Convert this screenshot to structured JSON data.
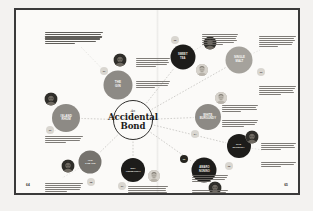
{
  "spread": {
    "publication_style": "magazine-feature-spread",
    "background_color": "#f3f2f0",
    "page_color": "#fbfaf8",
    "frame_color": "#3a3a3a"
  },
  "hub": {
    "kicker": "An",
    "title_line_1": "Accidental",
    "title_line_2": "Bond",
    "outline_color": "#2e2d2b"
  },
  "folios": {
    "left": "64",
    "right": "65"
  },
  "palette": {
    "node_dark": "#1d1c1a",
    "node_gray": "#8d8a85",
    "node_gray_light": "#a5a29c",
    "node_gray_dark": "#76736e",
    "badge_light": "#d9d6d0",
    "badge_dark": "#26251f",
    "text_body": "#6d6a65"
  },
  "nodes": [
    {
      "id": "n1",
      "label_line_1": "THE",
      "label_line_2": "GIN",
      "tone": "gray",
      "x": 102,
      "y": 75,
      "d": 29
    },
    {
      "id": "n2",
      "label_line_1": "SWEET",
      "label_line_2": "TEA",
      "tone": "dark",
      "x": 167,
      "y": 47,
      "d": 25
    },
    {
      "id": "n3",
      "label_line_1": "SINGLE",
      "label_line_2": "MALT",
      "tone": "gray2",
      "x": 223,
      "y": 50,
      "d": 27
    },
    {
      "id": "n4",
      "label_line_1": "WHITE",
      "label_line_2": "BURGUNDY",
      "tone": "gray",
      "x": 192,
      "y": 107,
      "d": 26
    },
    {
      "id": "n5",
      "label_line_1": "RYE",
      "label_line_2": "WHISKEY",
      "tone": "dark",
      "x": 223,
      "y": 136,
      "d": 24
    },
    {
      "id": "n6",
      "label_line_1": "AMARO",
      "label_line_2": "NONINO",
      "tone": "dark",
      "x": 188,
      "y": 160,
      "d": 25
    },
    {
      "id": "n7",
      "label_line_1": "DRY",
      "label_line_2": "VERMOUTH",
      "tone": "dark",
      "x": 117,
      "y": 160,
      "d": 24
    },
    {
      "id": "n8",
      "label_line_1": "OLD",
      "label_line_2": "TOM GIN",
      "tone": "gray3",
      "x": 74,
      "y": 152,
      "d": 23
    },
    {
      "id": "n9",
      "label_line_1": "ISLAND",
      "label_line_2": "RHUM",
      "tone": "gray",
      "x": 50,
      "y": 108,
      "d": 28
    }
  ],
  "badges": [
    {
      "id": "b1",
      "value": "01",
      "tone": "light",
      "x": 88,
      "y": 61,
      "d": 8
    },
    {
      "id": "b2",
      "value": "02",
      "tone": "light",
      "x": 159,
      "y": 30,
      "d": 8
    },
    {
      "id": "b3",
      "value": "03",
      "tone": "light",
      "x": 245,
      "y": 62,
      "d": 8
    },
    {
      "id": "b4",
      "value": "04",
      "tone": "light",
      "x": 179,
      "y": 124,
      "d": 8
    },
    {
      "id": "b5",
      "value": "05",
      "tone": "light",
      "x": 213,
      "y": 156,
      "d": 8
    },
    {
      "id": "b6",
      "value": "06",
      "tone": "dark",
      "x": 168,
      "y": 149,
      "d": 8
    },
    {
      "id": "b7",
      "value": "07",
      "tone": "light",
      "x": 106,
      "y": 176,
      "d": 8
    },
    {
      "id": "b8",
      "value": "08",
      "tone": "light",
      "x": 75,
      "y": 172,
      "d": 8
    },
    {
      "id": "b9",
      "value": "09",
      "tone": "light",
      "x": 34,
      "y": 120,
      "d": 8
    }
  ],
  "portraits": [
    {
      "id": "p1",
      "x": 104,
      "y": 50,
      "d": 13,
      "tone": "dark"
    },
    {
      "id": "p2",
      "x": 194,
      "y": 33,
      "d": 13,
      "tone": "dark"
    },
    {
      "id": "p3",
      "x": 186,
      "y": 60,
      "d": 12,
      "tone": "light"
    },
    {
      "id": "p4",
      "x": 205,
      "y": 88,
      "d": 12,
      "tone": "light"
    },
    {
      "id": "p5",
      "x": 236,
      "y": 127,
      "d": 13,
      "tone": "dark"
    },
    {
      "id": "p6",
      "x": 199,
      "y": 178,
      "d": 13,
      "tone": "dark"
    },
    {
      "id": "p7",
      "x": 138,
      "y": 166,
      "d": 12,
      "tone": "light"
    },
    {
      "id": "p8",
      "x": 52,
      "y": 156,
      "d": 13,
      "tone": "dark"
    },
    {
      "id": "p9",
      "x": 35,
      "y": 89,
      "d": 13,
      "tone": "dark"
    }
  ],
  "copy_blocks": [
    {
      "id": "c1",
      "x": 29,
      "y": 22,
      "w": 58,
      "lead": true,
      "lines": [
        100,
        96,
        98,
        94,
        88,
        52
      ]
    },
    {
      "id": "c2",
      "x": 120,
      "y": 48,
      "w": 34,
      "lead": false,
      "lines": [
        100,
        95,
        97,
        92,
        60
      ]
    },
    {
      "id": "c3",
      "x": 120,
      "y": 71,
      "w": 34,
      "lead": false,
      "lines": [
        100,
        96,
        93,
        55
      ]
    },
    {
      "id": "c4",
      "x": 186,
      "y": 24,
      "w": 36,
      "lead": false,
      "lines": [
        100,
        97,
        94,
        96,
        90,
        58
      ]
    },
    {
      "id": "c5",
      "x": 243,
      "y": 26,
      "w": 37,
      "lead": false,
      "lines": [
        100,
        95,
        97,
        93,
        88,
        50
      ]
    },
    {
      "id": "c6",
      "x": 243,
      "y": 76,
      "w": 37,
      "lead": false,
      "lines": [
        100,
        96,
        92,
        95,
        60
      ]
    },
    {
      "id": "c7",
      "x": 206,
      "y": 95,
      "w": 36,
      "lead": false,
      "lines": [
        100,
        94,
        96,
        52
      ]
    },
    {
      "id": "c8",
      "x": 206,
      "y": 110,
      "w": 36,
      "lead": false,
      "lines": [
        100,
        96,
        93,
        62
      ]
    },
    {
      "id": "c9",
      "x": 245,
      "y": 133,
      "w": 35,
      "lead": false,
      "lines": [
        100,
        95,
        97,
        58
      ]
    },
    {
      "id": "c10",
      "x": 245,
      "y": 152,
      "w": 35,
      "lead": false,
      "lines": [
        100,
        94,
        56
      ]
    },
    {
      "id": "c11",
      "x": 176,
      "y": 165,
      "w": 36,
      "lead": false,
      "lines": [
        100,
        96,
        92,
        54
      ]
    },
    {
      "id": "c12",
      "x": 176,
      "y": 180,
      "w": 36,
      "lead": false,
      "lines": [
        100,
        95,
        93,
        60
      ]
    },
    {
      "id": "c13",
      "x": 112,
      "y": 176,
      "w": 40,
      "lead": false,
      "lines": [
        100,
        96,
        94,
        97,
        90,
        55
      ]
    },
    {
      "id": "c14",
      "x": 29,
      "y": 173,
      "w": 38,
      "lead": false,
      "lines": [
        100,
        95,
        96,
        92,
        58
      ]
    },
    {
      "id": "c15",
      "x": 29,
      "y": 126,
      "w": 38,
      "lead": false,
      "lines": [
        100,
        96,
        93,
        56
      ]
    }
  ],
  "wires": {
    "color": "#9b9893",
    "style": "dashed",
    "hub_x": 117,
    "hub_y": 110,
    "hub_r": 20
  }
}
